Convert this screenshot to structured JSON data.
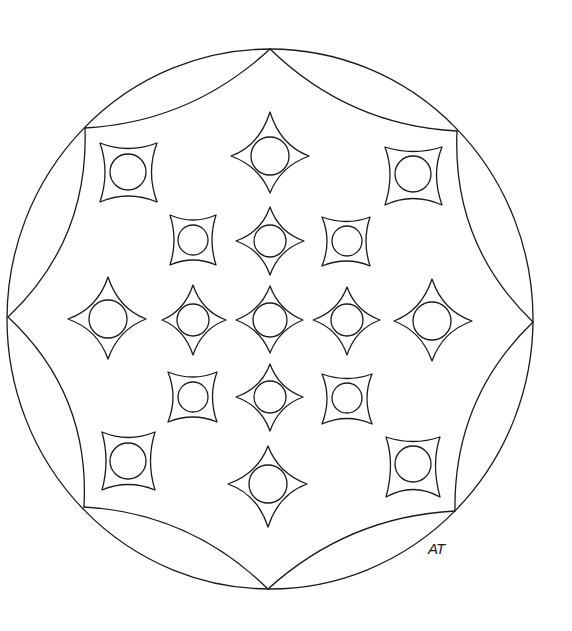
{
  "image": {
    "kind": "mandala-coloring-page",
    "background": "#ffffff",
    "stroke_color": "#1a1a1a"
  },
  "outer_circle": {
    "cx": 270,
    "cy": 319,
    "rx": 263,
    "ry": 270
  },
  "octagon_vertices": [
    [
      270,
      49
    ],
    [
      457,
      131
    ],
    [
      533,
      322
    ],
    [
      455,
      511
    ],
    [
      268,
      589
    ],
    [
      84,
      507
    ],
    [
      8,
      317
    ],
    [
      85,
      128
    ]
  ],
  "diamond_stars": [
    {
      "cx": 270,
      "cy": 156,
      "top": 112,
      "bottom": 193,
      "left": 231,
      "right": 309,
      "r": 19
    },
    {
      "cx": 270,
      "cy": 241,
      "top": 207,
      "bottom": 275,
      "left": 236,
      "right": 304,
      "r": 16
    },
    {
      "cx": 108,
      "cy": 319,
      "top": 277,
      "bottom": 359,
      "left": 68,
      "right": 146,
      "r": 19
    },
    {
      "cx": 193,
      "cy": 320,
      "top": 285,
      "bottom": 355,
      "left": 162,
      "right": 226,
      "r": 16
    },
    {
      "cx": 270,
      "cy": 320,
      "top": 286,
      "bottom": 353,
      "left": 236,
      "right": 303,
      "r": 17
    },
    {
      "cx": 347,
      "cy": 320,
      "top": 287,
      "bottom": 355,
      "left": 313,
      "right": 380,
      "r": 16
    },
    {
      "cx": 432,
      "cy": 321,
      "top": 279,
      "bottom": 361,
      "left": 394,
      "right": 472,
      "r": 19
    },
    {
      "cx": 270,
      "cy": 397,
      "top": 364,
      "bottom": 431,
      "left": 236,
      "right": 303,
      "r": 16
    },
    {
      "cx": 268,
      "cy": 484,
      "top": 446,
      "bottom": 527,
      "left": 228,
      "right": 307,
      "r": 19
    }
  ],
  "square_stars": [
    {
      "cx": 128,
      "cy": 172,
      "x1": 100,
      "y1": 143,
      "x2": 157,
      "y2": 202,
      "r": 18
    },
    {
      "cx": 413,
      "cy": 174,
      "x1": 385,
      "y1": 147,
      "x2": 442,
      "y2": 205,
      "r": 18
    },
    {
      "cx": 193,
      "cy": 240,
      "x1": 170,
      "y1": 215,
      "x2": 216,
      "y2": 265,
      "r": 15
    },
    {
      "cx": 347,
      "cy": 241,
      "x1": 322,
      "y1": 217,
      "x2": 370,
      "y2": 266,
      "r": 15
    },
    {
      "cx": 193,
      "cy": 397,
      "x1": 168,
      "y1": 372,
      "x2": 217,
      "y2": 422,
      "r": 15
    },
    {
      "cx": 347,
      "cy": 398,
      "x1": 322,
      "y1": 374,
      "x2": 372,
      "y2": 424,
      "r": 15
    },
    {
      "cx": 128,
      "cy": 461,
      "x1": 102,
      "y1": 432,
      "x2": 155,
      "y2": 490,
      "r": 18
    },
    {
      "cx": 413,
      "cy": 464,
      "x1": 386,
      "y1": 437,
      "x2": 440,
      "y2": 497,
      "r": 18
    }
  ],
  "signature": {
    "text": "AT",
    "x": 428,
    "y": 540
  }
}
